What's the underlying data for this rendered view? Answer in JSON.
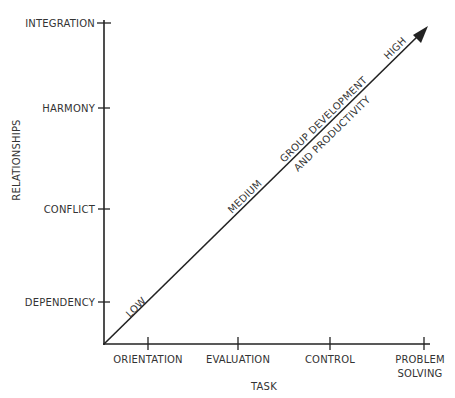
{
  "diagram": {
    "y_axis": {
      "title": "RELATIONSHIPS",
      "ticks": [
        "DEPENDENCY",
        "CONFLICT",
        "HARMONY",
        "INTEGRATION"
      ]
    },
    "x_axis": {
      "title": "TASK",
      "ticks": [
        "ORIENTATION",
        "EVALUATION",
        "CONTROL",
        "PROBLEM SOLVING"
      ],
      "tick_line1": [
        "ORIENTATION",
        "EVALUATION",
        "CONTROL",
        "PROBLEM"
      ],
      "tick_line2": [
        "",
        "",
        "",
        "SOLVING"
      ]
    },
    "arrow": {
      "labels_above": [
        "LOW",
        "MEDIUM",
        "HIGH"
      ],
      "caption_line1": "GROUP DEVELOPMENT",
      "caption_line2": "AND PRODUCTIVITY"
    },
    "colors": {
      "line": "#222222",
      "text": "#333333",
      "background": "#ffffff"
    }
  }
}
